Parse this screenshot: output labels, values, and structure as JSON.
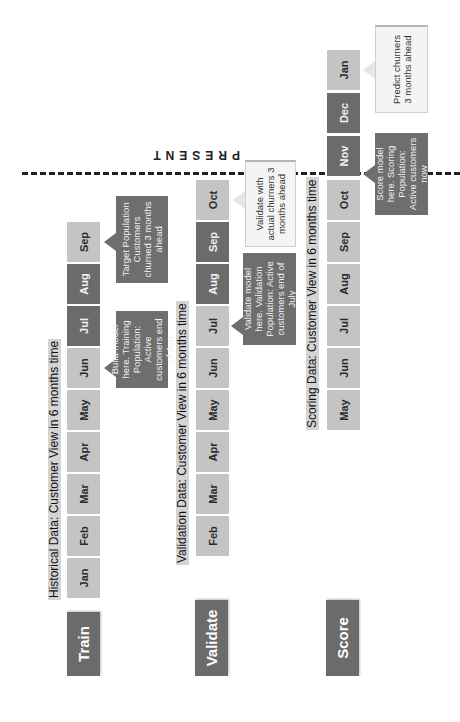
{
  "present_marker": {
    "label": "PRESENT"
  },
  "colors": {
    "dark": "#6b6b6b",
    "light": "#c4c4c4",
    "title_bg": "#d4d4d4",
    "callout_light": "#f4f4f4"
  },
  "rows": {
    "train": {
      "phase": "Train",
      "title": "Historical Data: Customer View in 6 months time",
      "months": [
        {
          "label": "Jan",
          "shade": "light"
        },
        {
          "label": "Feb",
          "shade": "light"
        },
        {
          "label": "Mar",
          "shade": "light"
        },
        {
          "label": "Apr",
          "shade": "light"
        },
        {
          "label": "May",
          "shade": "light"
        },
        {
          "label": "Jun",
          "shade": "light"
        },
        {
          "label": "Jul",
          "shade": "dark"
        },
        {
          "label": "Aug",
          "shade": "dark"
        },
        {
          "label": "Sep",
          "shade": "light"
        }
      ],
      "callouts": [
        {
          "text": "Build model here. Training Population: Active customers end of Jun",
          "style": "dark"
        },
        {
          "text": "Target Population Customers churned 3 months ahead",
          "style": "dark"
        }
      ]
    },
    "validate": {
      "phase": "Validate",
      "title": "Validation Data: Customer View in 6 months time",
      "months": [
        {
          "label": "Feb",
          "shade": "light"
        },
        {
          "label": "Mar",
          "shade": "light"
        },
        {
          "label": "Apr",
          "shade": "light"
        },
        {
          "label": "May",
          "shade": "light"
        },
        {
          "label": "Jun",
          "shade": "light"
        },
        {
          "label": "Jul",
          "shade": "light"
        },
        {
          "label": "Aug",
          "shade": "dark"
        },
        {
          "label": "Sep",
          "shade": "dark"
        },
        {
          "label": "Oct",
          "shade": "light"
        }
      ],
      "callouts": [
        {
          "text": "Validate model here. Validation Population: Active customers end of July",
          "style": "dark"
        },
        {
          "text": "Validate with actual churners 3 months ahead",
          "style": "light"
        }
      ]
    },
    "score": {
      "phase": "Score",
      "title": "Scoring Data: Customer View in 6 months time",
      "months": [
        {
          "label": "May",
          "shade": "light"
        },
        {
          "label": "Jun",
          "shade": "light"
        },
        {
          "label": "Jul",
          "shade": "light"
        },
        {
          "label": "Aug",
          "shade": "light"
        },
        {
          "label": "Sep",
          "shade": "light"
        },
        {
          "label": "Oct",
          "shade": "light"
        },
        {
          "label": "Nov",
          "shade": "dark"
        },
        {
          "label": "Dec",
          "shade": "dark"
        },
        {
          "label": "Jan",
          "shade": "light"
        }
      ],
      "callouts": [
        {
          "text": "Score model here. Scoring Population: Active customers now",
          "style": "dark"
        },
        {
          "text": "Predict churners 3 months ahead",
          "style": "light"
        }
      ]
    }
  }
}
